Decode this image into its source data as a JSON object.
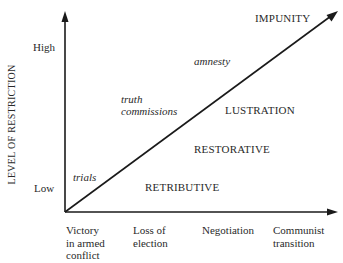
{
  "diagram": {
    "y_axis": {
      "label": "LEVEL OF RESTRICTION",
      "ticks": {
        "high": "High",
        "low": "Low"
      }
    },
    "x_axis": {
      "ticks": [
        {
          "line1": "Victory",
          "line2": "in armed",
          "line3": "conflict"
        },
        {
          "line1": "Loss of",
          "line2": "election",
          "line3": ""
        },
        {
          "line1": "Negotiation",
          "line2": "",
          "line3": ""
        },
        {
          "line1": "Communist",
          "line2": "transition",
          "line3": ""
        }
      ]
    },
    "diagonal_labels": {
      "trials": "trials",
      "truth_commissions_1": "truth",
      "truth_commissions_2": "commissions",
      "amnesty": "amnesty"
    },
    "regions": {
      "impunity": "IMPUNITY",
      "lustration": "LUSTRATION",
      "restorative": "RESTORATIVE",
      "retributive": "RETRIBUTIVE"
    },
    "colors": {
      "line": "#1a1a1a",
      "text": "#2a2a2a"
    }
  }
}
